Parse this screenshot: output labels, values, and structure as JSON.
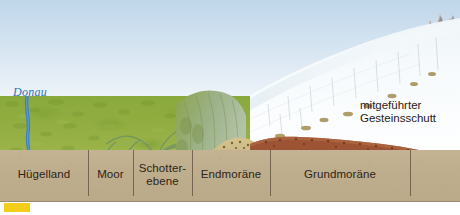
{
  "diagram": {
    "type": "geological-cross-section"
  },
  "sky": {
    "top_color": "#bfd6ea",
    "bottom_color": "#ffffff"
  },
  "river": {
    "name": "Donau",
    "color": "#3a7fc4",
    "label_color": "#2f74b5"
  },
  "glacier": {
    "name": "ice-sheet",
    "ice_color": "#f4f8fb",
    "debris_color": "#a8965e",
    "debris_count": 9,
    "crevasse_count": 11
  },
  "peaks": {
    "name": "nunatak-peaks",
    "rock_color": "#a89686"
  },
  "terrain": {
    "hill_color": "#90ad40",
    "ridge_color": "#9fb283",
    "endmoraine_color": "#cdbb86",
    "endmoraine_dot_color": "#6b5a32",
    "till_color": "#9c5434",
    "substrate_color": "#bfae8d"
  },
  "callouts": [
    {
      "name": "mitgefuehrter-gesteinsschutt",
      "text": "mitgeführter\nGesteinsschutt",
      "x": 360,
      "y": 99
    }
  ],
  "zones": [
    {
      "name": "huegelland",
      "label": "Hügelland",
      "start": 0,
      "end": 88
    },
    {
      "name": "moor",
      "label": "Moor",
      "start": 88,
      "end": 133
    },
    {
      "name": "schotterebene",
      "label": "Schotter-\nebene",
      "start": 133,
      "end": 192
    },
    {
      "name": "endmoraene",
      "label": "Endmoräne",
      "start": 192,
      "end": 270
    },
    {
      "name": "grundmoraene",
      "label": "Grundmoräne",
      "start": 270,
      "end": 410
    },
    {
      "name": "unlabeled",
      "label": "",
      "start": 410,
      "end": 460
    }
  ],
  "legend_swatch": {
    "name": "yellow-color-swatch",
    "color": "#f2ce1b"
  }
}
